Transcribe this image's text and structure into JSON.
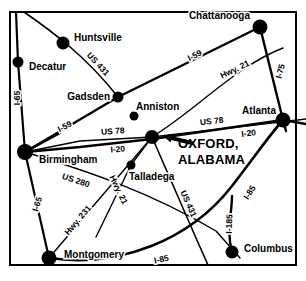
{
  "map": {
    "title": "OXFORD, ALABAMA regional highway map",
    "border": {
      "x": 10,
      "y": 12,
      "width": 286,
      "height": 253,
      "color": "#000000"
    },
    "callout": {
      "line1": "OXFORD,",
      "line2": "ALABAMA",
      "text_x": 178,
      "text_y": 148,
      "arrow_tail_x": 192,
      "arrow_tail_y": 143,
      "arrow_head_x": 163,
      "arrow_head_y": 136
    },
    "cities": [
      {
        "name": "Huntsville",
        "label": "Huntsville",
        "x": 63,
        "y": 43,
        "r": 6.5,
        "lx": 74,
        "ly": 41,
        "anchor": "start"
      },
      {
        "name": "Decatur",
        "label": "Decatur",
        "x": 18,
        "y": 62,
        "r": 5.5,
        "lx": 29,
        "ly": 70,
        "anchor": "start"
      },
      {
        "name": "Chattanooga",
        "label": "Chattanooga",
        "x": 260,
        "y": 27,
        "r": 7.5,
        "lx": 250,
        "ly": 19,
        "anchor": "end"
      },
      {
        "name": "Gadsden",
        "label": "Gadsden",
        "x": 118,
        "y": 97,
        "r": 5.5,
        "lx": 110,
        "ly": 100,
        "anchor": "end"
      },
      {
        "name": "Anniston",
        "label": "Anniston",
        "x": 134,
        "y": 116,
        "r": 4.5,
        "lx": 136,
        "ly": 110,
        "anchor": "start"
      },
      {
        "name": "Atlanta",
        "label": "Atlanta",
        "x": 283,
        "y": 120,
        "r": 7.5,
        "lx": 276,
        "ly": 114,
        "anchor": "end"
      },
      {
        "name": "Oxford",
        "label": "",
        "x": 152,
        "y": 137,
        "r": 7.0,
        "lx": 152,
        "ly": 137,
        "anchor": "start"
      },
      {
        "name": "Birmingham",
        "label": "Birmingham",
        "x": 25,
        "y": 152,
        "r": 8.0,
        "lx": 39,
        "ly": 163,
        "anchor": "start"
      },
      {
        "name": "Talladega",
        "label": "Talladega",
        "x": 131,
        "y": 165,
        "r": 4.5,
        "lx": 129,
        "ly": 180,
        "anchor": "start"
      },
      {
        "name": "Montgomery",
        "label": "Montgomery",
        "x": 49,
        "y": 258,
        "r": 7.5,
        "lx": 64,
        "ly": 258,
        "anchor": "start"
      },
      {
        "name": "Columbus",
        "label": "Columbus",
        "x": 232,
        "y": 252,
        "r": 6.5,
        "lx": 244,
        "ly": 252,
        "anchor": "start"
      }
    ],
    "routes": [
      {
        "id": "i-65-north",
        "label": "I-65",
        "d": "M 16 12 L 18 62 L 25 152",
        "width": 2.2,
        "lx": 20,
        "ly": 98,
        "rot": -90
      },
      {
        "id": "i-65-south",
        "label": "I-65",
        "d": "M 25 152 L 49 258 L 52 265",
        "width": 2.2,
        "lx": 40,
        "ly": 205,
        "rot": -72
      },
      {
        "id": "us-431-north",
        "label": "US 431",
        "d": "M 24 12 C 50 30 85 55 118 97",
        "width": 1.6,
        "lx": 96,
        "ly": 66,
        "rot": 47
      },
      {
        "id": "us-431-south",
        "label": "US 431",
        "d": "M 152 137 L 196 238 L 208 265",
        "width": 1.6,
        "lx": 186,
        "ly": 205,
        "rot": 66
      },
      {
        "id": "i-59-ne",
        "label": "I-59",
        "d": "M 25 152 L 118 97 L 260 27",
        "width": 2.4,
        "lx": 196,
        "ly": 58,
        "rot": -27
      },
      {
        "id": "i-59-sw",
        "label": "I-59",
        "d": "M 25 152 L 60 133",
        "width": 2.4,
        "lx": 66,
        "ly": 129,
        "rot": -27
      },
      {
        "id": "i-75",
        "label": "I-75",
        "d": "M 260 27 L 283 120 L 286 131",
        "width": 2.4,
        "lx": 283,
        "ly": 72,
        "rot": -76
      },
      {
        "id": "hwy-21-north",
        "label": "Hwy. 21",
        "d": "M 152 137 C 196 110 236 66 283 48",
        "width": 1.4,
        "lx": 236,
        "ly": 72,
        "rot": -26
      },
      {
        "id": "hwy-21-south",
        "label": "Hwy. 21",
        "d": "M 152 137 L 131 165 L 96 237",
        "width": 1.4,
        "lx": 116,
        "ly": 191,
        "rot": 64
      },
      {
        "id": "us-78-east",
        "label": "US 78",
        "d": "M 152 137 L 306 119",
        "width": 1.6,
        "lx": 212,
        "ly": 124,
        "rot": -6
      },
      {
        "id": "us-78-west",
        "label": "US 78",
        "d": "M 152 137 L 80 141 L 25 152",
        "width": 1.6,
        "lx": 113,
        "ly": 134,
        "rot": -4
      },
      {
        "id": "i-20-east",
        "label": "I-20",
        "d": "M 152 139 L 283 120 L 306 124",
        "width": 2.4,
        "lx": 249,
        "ly": 136,
        "rot": -7
      },
      {
        "id": "i-20-west",
        "label": "I-20",
        "d": "M 152 139 L 80 147 L 25 152",
        "width": 2.4,
        "lx": 118,
        "ly": 152,
        "rot": -4
      },
      {
        "id": "us-280",
        "label": "US 280",
        "d": "M 25 152 C 90 172 150 192 216 231 L 240 258",
        "width": 1.4,
        "lx": 75,
        "ly": 183,
        "rot": 19
      },
      {
        "id": "hwy-231",
        "label": "Hwy. 231",
        "d": "M 49 258 L 152 137",
        "width": 1.4,
        "lx": 80,
        "ly": 222,
        "rot": -50
      },
      {
        "id": "i-85",
        "label": "I-85",
        "d": "M 49 258 C 120 268 190 240 232 186 C 258 152 272 132 283 120",
        "width": 2.6,
        "lx": 162,
        "ly": 262,
        "rot": -12
      },
      {
        "id": "i-85-label2",
        "label": "I-85",
        "d": "",
        "width": 0,
        "lx": 252,
        "ly": 194,
        "rot": -57
      },
      {
        "id": "i-185",
        "label": "I-185",
        "d": "M 232 252 C 226 230 232 214 232 196",
        "width": 2.4,
        "lx": 232,
        "ly": 224,
        "rot": -88
      }
    ]
  }
}
